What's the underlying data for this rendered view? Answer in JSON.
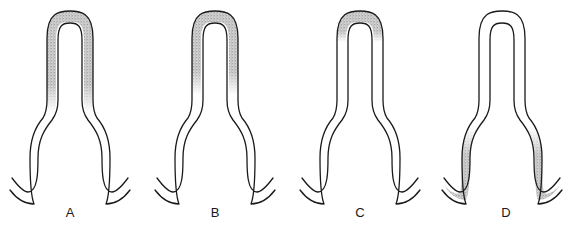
{
  "figure": {
    "panels": [
      {
        "id": "A",
        "label": "A",
        "offset_x": 0,
        "shading": "arch-and-upper-limbs"
      },
      {
        "id": "B",
        "label": "B",
        "offset_x": 145,
        "shading": "arch-and-upper-limbs-shorter"
      },
      {
        "id": "C",
        "label": "C",
        "offset_x": 290,
        "shading": "arch-only"
      },
      {
        "id": "D",
        "label": "D",
        "offset_x": 432,
        "shading": "lower-limbs-and-hooks"
      }
    ],
    "colors": {
      "stroke": "#1a1a1a",
      "stipple": "#8a8a8a",
      "background": "#ffffff"
    }
  }
}
